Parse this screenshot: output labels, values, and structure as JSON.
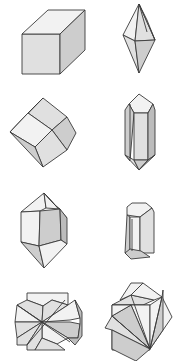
{
  "figure": {
    "background": "#ffffff",
    "stroke": "#3a3a3a",
    "shades": {
      "light": "#f2f2f2",
      "mid": "#e0e0e0",
      "dark": "#cdcdcd",
      "darker": "#bcbcbc"
    },
    "crystals": [
      {
        "name": "cube",
        "faces": [
          {
            "shade": "mid",
            "points": "22,34 60,34 60,74 22,74"
          },
          {
            "shade": "light",
            "points": "22,34 48,10 85,10 60,34"
          },
          {
            "shade": "dark",
            "points": "60,34 85,10 85,50 60,74"
          }
        ],
        "lines": []
      },
      {
        "name": "hexagonal-bipyramid",
        "faces": [
          {
            "shade": "light",
            "points": "139,4 123,35 135,41"
          },
          {
            "shade": "mid",
            "points": "139,4 135,41 155,40"
          },
          {
            "shade": "light",
            "points": "139,4 147,20 155,40"
          },
          {
            "shade": "mid",
            "points": "123,35 135,41 139,73"
          },
          {
            "shade": "dark",
            "points": "135,41 155,40 139,73"
          }
        ],
        "lines": [
          [
            "139,4",
            "147,32"
          ]
        ]
      },
      {
        "name": "rhombic-dodecahedron",
        "faces": [
          {
            "shade": "mid",
            "points": "43,98 67,117 52,130 28,113"
          },
          {
            "shade": "light",
            "points": "43,98 28,113 10,132"
          },
          {
            "shade": "light",
            "points": "28,113 52,130 35,147 10,132"
          },
          {
            "shade": "dark",
            "points": "67,117 76,133 67,150 52,130"
          },
          {
            "shade": "mid",
            "points": "52,130 67,150 43,167 35,147"
          },
          {
            "shade": "dark",
            "points": "10,132 35,147 43,167"
          }
        ],
        "lines": []
      },
      {
        "name": "quartz-prism",
        "faces": [
          {
            "shade": "light",
            "points": "139,94 129,104 134,113 148,113 153,104"
          },
          {
            "shade": "dark",
            "points": "129,104 125,110 125,155 130,161 134,113"
          },
          {
            "shade": "mid",
            "points": "134,113 148,113 148,160 134,160"
          },
          {
            "shade": "darker",
            "points": "148,113 153,104 155,110 155,155 148,160"
          },
          {
            "shade": "mid",
            "points": "125,155 134,160 139,170"
          },
          {
            "shade": "dark",
            "points": "134,160 148,160 139,170"
          },
          {
            "shade": "darker",
            "points": "148,160 155,155 139,170"
          }
        ],
        "lines": [
          [
            "130,104",
            "130,160"
          ]
        ]
      },
      {
        "name": "quartz-doubly-terminated",
        "faces": [
          {
            "shade": "light",
            "points": "44,193 21,212 40,211 46,208"
          },
          {
            "shade": "light",
            "points": "44,193 46,208 60,209 55,205"
          },
          {
            "shade": "light",
            "points": "44,193 55,205 67,218"
          },
          {
            "shade": "light",
            "points": "21,212 40,211 39,246 21,242"
          },
          {
            "shade": "dark",
            "points": "40,211 60,209 61,240 39,246"
          },
          {
            "shade": "darker",
            "points": "60,209 67,218 67,244 61,240"
          },
          {
            "shade": "dark",
            "points": "21,242 39,246 44,268"
          },
          {
            "shade": "light",
            "points": "39,246 61,240 67,244 44,268"
          }
        ],
        "lines": []
      },
      {
        "name": "short-prism",
        "faces": [
          {
            "shade": "light",
            "points": "127,207 132,203 146,203 152,208 140,217 127,215"
          },
          {
            "shade": "dark",
            "points": "127,215 130,217 130,256 125,253"
          },
          {
            "shade": "light",
            "points": "130,217 140,217 140,253 130,256"
          },
          {
            "shade": "mid",
            "points": "140,217 152,208 154,212 154,253 140,253"
          },
          {
            "shade": "dark",
            "points": "125,253 130,249 141,251 150,257 131,259"
          }
        ],
        "lines": [
          [
            "132,219",
            "132,251"
          ]
        ]
      },
      {
        "name": "twinned-cube-penetration",
        "faces": [
          {
            "shade": "light",
            "points": "27,293 68,293 68,305 52,300 43,306 27,300"
          },
          {
            "shade": "mid",
            "points": "17,305 27,300 43,306 42,322"
          },
          {
            "shade": "mid",
            "points": "43,306 52,300 68,305 42,322"
          },
          {
            "shade": "light",
            "points": "68,305 75,300 80,318 70,320 42,322"
          },
          {
            "shade": "light",
            "points": "17,305 42,322 15,322"
          },
          {
            "shade": "mid",
            "points": "15,322 42,322 17,338"
          },
          {
            "shade": "dark",
            "points": "42,322 70,322 80,324 78,338 68,338"
          },
          {
            "shade": "mid",
            "points": "17,338 42,322 27,345 17,345"
          },
          {
            "shade": "light",
            "points": "42,322 68,338 57,344 42,338"
          },
          {
            "shade": "mid",
            "points": "27,345 42,322 42,338 35,350 27,350"
          },
          {
            "shade": "mid",
            "points": "42,338 57,344 65,350 35,350"
          },
          {
            "shade": "darker",
            "points": "75,300 82,312 82,336 75,345 68,338 78,338 80,324 80,318"
          }
        ],
        "lines": [
          [
            "17,305",
            "70,342"
          ],
          [
            "27,345",
            "65,300"
          ]
        ]
      },
      {
        "name": "twinned-cube-interpenetration",
        "faces": [
          {
            "shade": "mid",
            "points": "112,305 131,295 154,300 143,305"
          },
          {
            "shade": "light",
            "points": "131,295 143,283 162,297 154,300"
          },
          {
            "shade": "light",
            "points": "120,300 131,283 143,283 131,295"
          },
          {
            "shade": "mid",
            "points": "112,305 150,305 150,350 112,350"
          },
          {
            "shade": "light",
            "points": "131,305 150,305 150,349"
          },
          {
            "shade": "dark",
            "points": "112,316 131,305 150,349"
          },
          {
            "shade": "light",
            "points": "150,305 162,297 172,317 150,349"
          },
          {
            "shade": "dark",
            "points": "162,297 163,290 163,330 150,349"
          },
          {
            "shade": "mid",
            "points": "105,328 112,316 150,349 112,330"
          },
          {
            "shade": "dark",
            "points": "112,330 150,349 136,361 112,349"
          },
          {
            "shade": "light",
            "points": "112,316 131,305 112,305"
          }
        ],
        "lines": [
          [
            "131,295",
            "150,349"
          ],
          [
            "112,316",
            "150,349"
          ],
          [
            "162,297",
            "150,349"
          ]
        ]
      }
    ]
  }
}
